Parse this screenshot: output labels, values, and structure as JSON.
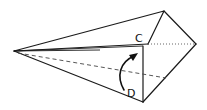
{
  "diagram": {
    "type": "origami-fold-step",
    "labels": {
      "c": "C",
      "d": "D"
    },
    "vertices": {
      "left_point": [
        14,
        51
      ],
      "top": [
        164,
        11
      ],
      "right": [
        196,
        44
      ],
      "bottom": [
        143,
        102
      ],
      "c_corner": [
        148,
        44
      ],
      "flap_top": [
        143,
        46
      ],
      "dashed_end": [
        166,
        78
      ]
    },
    "lines": {
      "solid": "outline of folded paper model",
      "dotted": "hidden edge from C to right vertex",
      "dashed": "fold line from left point to lower-right edge"
    },
    "arrow": {
      "kind": "curved-fold-arrow",
      "from_label": "D",
      "direction": "up"
    },
    "colors": {
      "ink": "#1a1a1a",
      "background": "#ffffff"
    }
  }
}
